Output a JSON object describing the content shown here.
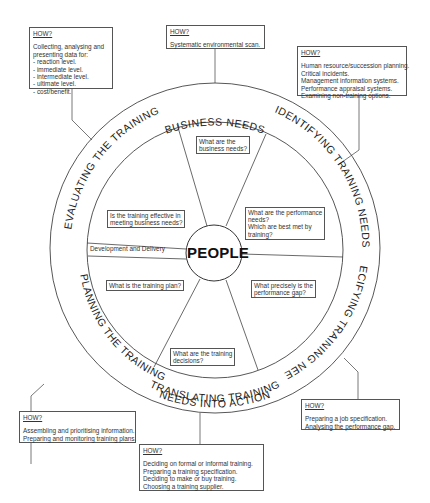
{
  "center_label": "PEOPLE",
  "ring_labels": {
    "top": "BUSINESS NEEDS",
    "upper_right": "IDENTIFYING TRAINING NEEDS",
    "lower_right": "SPECIFYING TRAINING NEEDS",
    "bottom_line1": "TRANSLATING TRAINING",
    "bottom_line2": "NEEDS INTO ACTION",
    "lower_left": "PLANNING THE TRAINING",
    "upper_left": "EVALUATING THE TRAINING"
  },
  "inner_questions": {
    "business": [
      "What are the",
      "business needs?"
    ],
    "performance": [
      "What are the performance",
      "needs?",
      "Which are best met by",
      "training?"
    ],
    "gap": [
      "What precisely is the",
      "performance gap?"
    ],
    "decisions": [
      "What are the training",
      "decisions?"
    ],
    "plan": [
      "What is the training plan?"
    ],
    "effective": [
      "Is the training effective in",
      "meeting business needs?"
    ],
    "development": [
      "Development and Delivery"
    ]
  },
  "how_boxes": {
    "heading": "HOW?",
    "evaluating": [
      "Collecting, analysing and",
      "presenting data for:",
      "- reaction level.",
      "- immediate level.",
      "- intermediate level.",
      "- ultimate level.",
      "- cost/benefit."
    ],
    "business": [
      "Systematic environmental scan."
    ],
    "identifying": [
      "Human resource/succession planning.",
      "Critical incidents.",
      "Management information systems.",
      "Performance appraisal systems.",
      "Examining non-training options."
    ],
    "specifying": [
      "Preparing a job specification.",
      "Analysing the performance gap."
    ],
    "translating": [
      "Deciding on formal or informal training.",
      "Preparing a training specification.",
      "Deciding to make or buy training.",
      "Choosing a training supplier."
    ],
    "planning": [
      "Assembling and prioritising information.",
      "Preparing and monitoring training plans."
    ]
  }
}
